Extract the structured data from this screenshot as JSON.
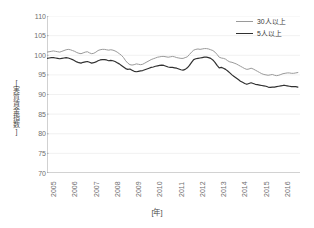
{
  "chart_data": {
    "type": "line",
    "title": "",
    "xlabel": "[年]",
    "ylabel": "[実質賃金指数]",
    "ylim": [
      70,
      110
    ],
    "ytick_step": 5,
    "yticks": [
      110,
      105,
      100,
      95,
      90,
      85,
      80,
      75,
      70
    ],
    "categories": [
      "2005",
      "2006",
      "2007",
      "2008",
      "2009",
      "2010",
      "2011",
      "2012",
      "2013",
      "2014",
      "2015",
      "2016"
    ],
    "x_range": [
      2005,
      2016.9
    ],
    "grid": "horizontal",
    "legend_position": "top-right",
    "series": [
      {
        "name": "30人以上",
        "color": "#9a9a9a",
        "x": [
          2005.0,
          2005.1,
          2005.2,
          2005.3,
          2005.4,
          2005.5,
          2005.6,
          2005.7,
          2005.8,
          2005.9,
          2006.0,
          2006.1,
          2006.2,
          2006.3,
          2006.4,
          2006.5,
          2006.6,
          2006.7,
          2006.8,
          2006.9,
          2007.0,
          2007.1,
          2007.2,
          2007.3,
          2007.4,
          2007.5,
          2007.6,
          2007.7,
          2007.8,
          2007.9,
          2008.0,
          2008.1,
          2008.2,
          2008.3,
          2008.4,
          2008.5,
          2008.6,
          2008.7,
          2008.8,
          2008.9,
          2009.0,
          2009.1,
          2009.2,
          2009.3,
          2009.4,
          2009.5,
          2009.6,
          2009.7,
          2009.8,
          2009.9,
          2010.0,
          2010.1,
          2010.2,
          2010.3,
          2010.4,
          2010.5,
          2010.6,
          2010.7,
          2010.8,
          2010.9,
          2011.0,
          2011.1,
          2011.2,
          2011.3,
          2011.4,
          2011.5,
          2011.6,
          2011.7,
          2011.8,
          2011.9,
          2012.0,
          2012.1,
          2012.2,
          2012.3,
          2012.4,
          2012.5,
          2012.6,
          2012.7,
          2012.8,
          2012.9,
          2013.0,
          2013.1,
          2013.2,
          2013.3,
          2013.4,
          2013.5,
          2013.6,
          2013.7,
          2013.8,
          2013.9,
          2014.0,
          2014.1,
          2014.2,
          2014.3,
          2014.4,
          2014.5,
          2014.6,
          2014.7,
          2014.8,
          2014.9,
          2015.0,
          2015.1,
          2015.2,
          2015.3,
          2015.4,
          2015.5,
          2015.6,
          2015.7,
          2015.8,
          2015.9,
          2016.0,
          2016.1,
          2016.2,
          2016.3,
          2016.4,
          2016.5,
          2016.6,
          2016.7,
          2016.8
        ],
        "values": [
          100.8,
          100.9,
          101.0,
          101.1,
          101.0,
          100.9,
          100.8,
          101.0,
          101.2,
          101.4,
          101.5,
          101.4,
          101.2,
          101.0,
          100.7,
          100.5,
          100.4,
          100.6,
          100.8,
          100.9,
          100.6,
          100.4,
          100.5,
          100.8,
          101.2,
          101.4,
          101.5,
          101.5,
          101.4,
          101.3,
          101.4,
          101.3,
          101.1,
          100.8,
          100.4,
          100.0,
          99.4,
          98.6,
          98.0,
          97.6,
          97.5,
          97.6,
          97.8,
          97.7,
          97.6,
          97.7,
          98.0,
          98.3,
          98.6,
          98.9,
          99.1,
          99.3,
          99.5,
          99.6,
          99.7,
          99.7,
          99.6,
          99.5,
          99.6,
          99.7,
          99.6,
          99.4,
          99.3,
          99.2,
          99.2,
          99.4,
          99.6,
          100.2,
          100.8,
          101.3,
          101.5,
          101.6,
          101.5,
          101.6,
          101.7,
          101.7,
          101.6,
          101.4,
          101.2,
          100.8,
          100.2,
          99.5,
          99.3,
          99.2,
          99.0,
          98.6,
          98.3,
          98.2,
          98.0,
          97.8,
          97.5,
          97.2,
          96.9,
          96.6,
          96.4,
          96.5,
          96.7,
          96.5,
          96.2,
          95.9,
          95.6,
          95.3,
          95.1,
          95.0,
          94.9,
          95.0,
          95.1,
          94.9,
          94.8,
          94.9,
          95.1,
          95.3,
          95.4,
          95.5,
          95.5,
          95.4,
          95.4,
          95.5,
          95.6
        ]
      },
      {
        "name": "5人以上",
        "color": "#303030",
        "x": [
          2005.0,
          2005.1,
          2005.2,
          2005.3,
          2005.4,
          2005.5,
          2005.6,
          2005.7,
          2005.8,
          2005.9,
          2006.0,
          2006.1,
          2006.2,
          2006.3,
          2006.4,
          2006.5,
          2006.6,
          2006.7,
          2006.8,
          2006.9,
          2007.0,
          2007.1,
          2007.2,
          2007.3,
          2007.4,
          2007.5,
          2007.6,
          2007.7,
          2007.8,
          2007.9,
          2008.0,
          2008.1,
          2008.2,
          2008.3,
          2008.4,
          2008.5,
          2008.6,
          2008.7,
          2008.8,
          2008.9,
          2009.0,
          2009.1,
          2009.2,
          2009.3,
          2009.4,
          2009.5,
          2009.6,
          2009.7,
          2009.8,
          2009.9,
          2010.0,
          2010.1,
          2010.2,
          2010.3,
          2010.4,
          2010.5,
          2010.6,
          2010.7,
          2010.8,
          2010.9,
          2011.0,
          2011.1,
          2011.2,
          2011.3,
          2011.4,
          2011.5,
          2011.6,
          2011.7,
          2011.8,
          2011.9,
          2012.0,
          2012.1,
          2012.2,
          2012.3,
          2012.4,
          2012.5,
          2012.6,
          2012.7,
          2012.8,
          2012.9,
          2013.0,
          2013.1,
          2013.2,
          2013.3,
          2013.4,
          2013.5,
          2013.6,
          2013.7,
          2013.8,
          2013.9,
          2014.0,
          2014.1,
          2014.2,
          2014.3,
          2014.4,
          2014.5,
          2014.6,
          2014.7,
          2014.8,
          2014.9,
          2015.0,
          2015.1,
          2015.2,
          2015.3,
          2015.4,
          2015.5,
          2015.6,
          2015.7,
          2015.8,
          2015.9,
          2016.0,
          2016.1,
          2016.2,
          2016.3,
          2016.4,
          2016.5,
          2016.6,
          2016.7,
          2016.8
        ],
        "values": [
          99.2,
          99.3,
          99.4,
          99.4,
          99.3,
          99.2,
          99.1,
          99.2,
          99.3,
          99.4,
          99.3,
          99.1,
          98.9,
          98.6,
          98.3,
          98.1,
          98.0,
          98.2,
          98.3,
          98.4,
          98.2,
          98.0,
          98.1,
          98.3,
          98.6,
          98.8,
          98.9,
          98.9,
          98.8,
          98.6,
          98.7,
          98.6,
          98.4,
          98.1,
          97.8,
          97.4,
          97.0,
          96.6,
          96.4,
          96.5,
          96.2,
          95.9,
          95.8,
          95.9,
          96.0,
          96.1,
          96.3,
          96.5,
          96.7,
          96.9,
          97.0,
          97.2,
          97.3,
          97.4,
          97.5,
          97.4,
          97.2,
          97.0,
          96.9,
          96.9,
          96.8,
          96.7,
          96.5,
          96.3,
          96.2,
          96.4,
          96.8,
          97.4,
          98.2,
          98.9,
          99.1,
          99.2,
          99.3,
          99.4,
          99.5,
          99.5,
          99.4,
          99.2,
          98.8,
          98.2,
          97.4,
          96.8,
          96.9,
          96.7,
          96.4,
          96.0,
          95.5,
          95.0,
          94.6,
          94.2,
          93.8,
          93.4,
          93.1,
          92.8,
          92.6,
          92.8,
          93.0,
          92.8,
          92.6,
          92.5,
          92.4,
          92.3,
          92.2,
          92.1,
          91.9,
          91.8,
          91.9,
          91.9,
          92.0,
          92.1,
          92.2,
          92.3,
          92.3,
          92.2,
          92.1,
          92.0,
          92.0,
          92.0,
          91.9
        ]
      }
    ]
  },
  "axes": {
    "y_title": "[実質賃金指数]",
    "x_title": "[年]",
    "y_tick_labels": [
      "110",
      "105",
      "100",
      "95",
      "90",
      "85",
      "80",
      "75",
      "70"
    ],
    "x_tick_labels": [
      "2005",
      "2006",
      "2007",
      "2008",
      "2009",
      "2010",
      "2011",
      "2012",
      "2013",
      "2014",
      "2015",
      "2016"
    ]
  },
  "legend": {
    "items": [
      {
        "label": "30人以上",
        "color": "#9a9a9a"
      },
      {
        "label": "5人以上",
        "color": "#303030"
      }
    ]
  },
  "colors": {
    "axis": "#9a9a9a",
    "grid": "#ededed",
    "text": "#6e6e6e",
    "series_30": "#9a9a9a",
    "series_5": "#303030"
  }
}
